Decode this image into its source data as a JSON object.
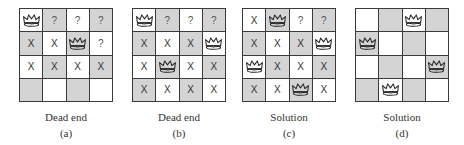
{
  "figure": {
    "legend": {
      "queen": "queen-icon",
      "attacked": "X",
      "unexplored": "?",
      "empty": ""
    },
    "colors": {
      "light_square": "#ffffff",
      "dark_square": "#d4d4d4",
      "grid_line": "#3a3a3a",
      "text": "#333333"
    },
    "panels": [
      {
        "caption": "Dead end",
        "sub": "(a)",
        "left": 19,
        "board": [
          [
            "Q",
            "?",
            "?",
            "?"
          ],
          [
            "X",
            "X",
            "Q",
            "?"
          ],
          [
            "X",
            "X",
            "X",
            "X"
          ],
          [
            "",
            "",
            "",
            ""
          ]
        ]
      },
      {
        "caption": "Dead end",
        "sub": "(b)",
        "left": 132,
        "board": [
          [
            "Q",
            "?",
            "?",
            "?"
          ],
          [
            "X",
            "X",
            "X",
            "Q"
          ],
          [
            "X",
            "Q",
            "X",
            "X"
          ],
          [
            "X",
            "X",
            "X",
            "X"
          ]
        ]
      },
      {
        "caption": "Solution",
        "sub": "(c)",
        "left": 242,
        "board": [
          [
            "X",
            "Q",
            "?",
            "?"
          ],
          [
            "X",
            "X",
            "X",
            "Q"
          ],
          [
            "Q",
            "X",
            "X",
            "X"
          ],
          [
            "X",
            "X",
            "Q",
            "X"
          ]
        ]
      },
      {
        "caption": "Solution",
        "sub": "(d)",
        "left": 355,
        "board": [
          [
            "",
            "",
            "Q",
            ""
          ],
          [
            "Q",
            "",
            "",
            ""
          ],
          [
            "",
            "",
            "",
            "Q"
          ],
          [
            "",
            "Q",
            "",
            ""
          ]
        ]
      }
    ]
  }
}
